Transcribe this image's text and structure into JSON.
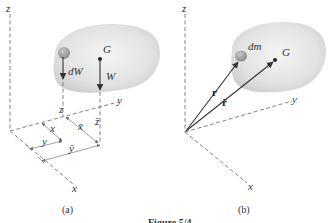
{
  "figure": {
    "caption": "Figure 5/4",
    "panels": [
      {
        "id": "a",
        "label": "(a)",
        "axes": {
          "x": "x",
          "y": "y",
          "z": "z"
        },
        "points": {
          "centroid": "G"
        },
        "forces": {
          "element": "dW",
          "total": "W"
        },
        "dimensions": {
          "x": "x",
          "y": "y",
          "z": "z",
          "x_bar": "x̄",
          "y_bar": "ȳ",
          "z_bar": "z̄"
        }
      },
      {
        "id": "b",
        "label": "(b)",
        "axes": {
          "x": "x",
          "y": "y",
          "z": "z"
        },
        "points": {
          "centroid": "G",
          "element": "dm"
        },
        "vectors": {
          "r": "r",
          "r_bar": "r̄"
        }
      }
    ]
  },
  "colors": {
    "body_fill": "#e6e6e6",
    "element_fill": "#a8a8a8",
    "line": "#333333"
  }
}
